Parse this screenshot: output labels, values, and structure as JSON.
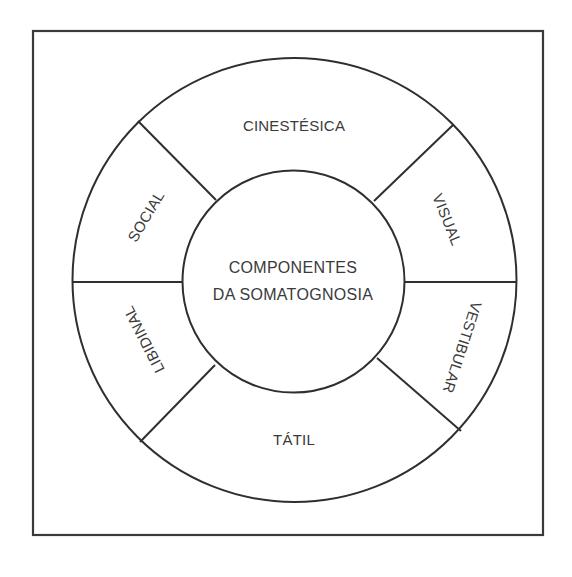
{
  "diagram": {
    "type": "concentric-ring-segments",
    "center": {
      "line1": "COMPONENTES",
      "line2": "DA SOMATOGNOSIA"
    },
    "segments": [
      {
        "id": "cinestesica",
        "label": "CINESTÉSICA",
        "position": "top"
      },
      {
        "id": "visual",
        "label": "VISUAL",
        "position": "upper-right"
      },
      {
        "id": "vestibular",
        "label": "VESTIBULAR",
        "position": "lower-right"
      },
      {
        "id": "tatil",
        "label": "TÁTIL",
        "position": "bottom"
      },
      {
        "id": "libidinal",
        "label": "LIBIDINAL",
        "position": "lower-left"
      },
      {
        "id": "social",
        "label": "SOCIAL",
        "position": "upper-left"
      }
    ],
    "colors": {
      "stroke": "#2f2f2f",
      "text": "#3a3a3a",
      "background": "#ffffff"
    }
  }
}
